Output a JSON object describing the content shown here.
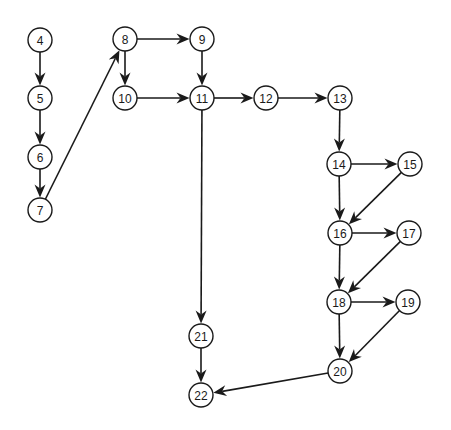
{
  "diagram": {
    "type": "directed-graph",
    "style": {
      "node_radius": 12,
      "stroke_color": "#1a1a1a",
      "fill_color": "#ffffff",
      "background": "#ffffff"
    },
    "nodes": [
      {
        "id": "4",
        "label": "4",
        "x": 40,
        "y": 40
      },
      {
        "id": "5",
        "label": "5",
        "x": 40,
        "y": 98
      },
      {
        "id": "6",
        "label": "6",
        "x": 40,
        "y": 157
      },
      {
        "id": "7",
        "label": "7",
        "x": 40,
        "y": 210
      },
      {
        "id": "8",
        "label": "8",
        "x": 125,
        "y": 39
      },
      {
        "id": "9",
        "label": "9",
        "x": 202,
        "y": 39
      },
      {
        "id": "10",
        "label": "10",
        "x": 125,
        "y": 98
      },
      {
        "id": "11",
        "label": "11",
        "x": 202,
        "y": 98
      },
      {
        "id": "12",
        "label": "12",
        "x": 266,
        "y": 98
      },
      {
        "id": "13",
        "label": "13",
        "x": 340,
        "y": 98
      },
      {
        "id": "14",
        "label": "14",
        "x": 339,
        "y": 164
      },
      {
        "id": "15",
        "label": "15",
        "x": 410,
        "y": 164
      },
      {
        "id": "16",
        "label": "16",
        "x": 340,
        "y": 233
      },
      {
        "id": "17",
        "label": "17",
        "x": 409,
        "y": 233
      },
      {
        "id": "18",
        "label": "18",
        "x": 339,
        "y": 302
      },
      {
        "id": "19",
        "label": "19",
        "x": 408,
        "y": 302
      },
      {
        "id": "20",
        "label": "20",
        "x": 340,
        "y": 371
      },
      {
        "id": "21",
        "label": "21",
        "x": 201,
        "y": 336
      },
      {
        "id": "22",
        "label": "22",
        "x": 201,
        "y": 395
      }
    ],
    "edges": [
      {
        "from": "4",
        "to": "5"
      },
      {
        "from": "5",
        "to": "6"
      },
      {
        "from": "6",
        "to": "7"
      },
      {
        "from": "7",
        "to": "8"
      },
      {
        "from": "8",
        "to": "9"
      },
      {
        "from": "8",
        "to": "10"
      },
      {
        "from": "9",
        "to": "11"
      },
      {
        "from": "10",
        "to": "11"
      },
      {
        "from": "11",
        "to": "12"
      },
      {
        "from": "11",
        "to": "21"
      },
      {
        "from": "12",
        "to": "13"
      },
      {
        "from": "13",
        "to": "14"
      },
      {
        "from": "14",
        "to": "15"
      },
      {
        "from": "14",
        "to": "16"
      },
      {
        "from": "15",
        "to": "16"
      },
      {
        "from": "16",
        "to": "17"
      },
      {
        "from": "16",
        "to": "18"
      },
      {
        "from": "17",
        "to": "18"
      },
      {
        "from": "18",
        "to": "19"
      },
      {
        "from": "18",
        "to": "20"
      },
      {
        "from": "19",
        "to": "20"
      },
      {
        "from": "20",
        "to": "22"
      },
      {
        "from": "21",
        "to": "22"
      }
    ]
  }
}
